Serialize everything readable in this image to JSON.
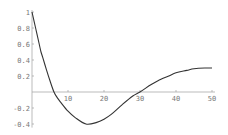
{
  "chart_data": {
    "type": "line",
    "title": "",
    "xlabel": "",
    "ylabel": "",
    "xlim": [
      0,
      50
    ],
    "ylim": [
      -0.42,
      1.0
    ],
    "grid": false,
    "legend": null,
    "x_ticks": [
      10,
      20,
      30,
      40,
      50
    ],
    "x_tick_labels": [
      "10",
      "20",
      "30",
      "40",
      "50"
    ],
    "y_ticks": [
      1,
      0.8,
      0.6,
      0.4,
      0.2,
      -0.2,
      -0.4
    ],
    "y_tick_labels": [
      "1",
      "0.8",
      "0.6",
      "0.4",
      "0.2",
      "-0.2",
      "-0.4"
    ],
    "series": [
      {
        "name": "curve",
        "color": "#333333",
        "x": [
          0,
          1,
          2,
          2.5,
          3,
          4,
          5,
          6.1,
          7,
          8,
          10,
          12,
          15,
          18,
          20,
          22,
          25,
          28,
          30,
          33,
          35,
          38,
          40,
          43,
          45,
          48,
          50
        ],
        "y": [
          1.0,
          0.8,
          0.6,
          0.5,
          0.43,
          0.28,
          0.14,
          0.0,
          -0.07,
          -0.13,
          -0.24,
          -0.32,
          -0.4,
          -0.38,
          -0.34,
          -0.28,
          -0.16,
          -0.05,
          0.0,
          0.09,
          0.14,
          0.2,
          0.24,
          0.27,
          0.29,
          0.3,
          0.3
        ]
      }
    ]
  },
  "colors": {
    "background": "#ffffff",
    "axis": "#aaaaaa",
    "curve": "#333333",
    "tick_text": "#777777"
  }
}
